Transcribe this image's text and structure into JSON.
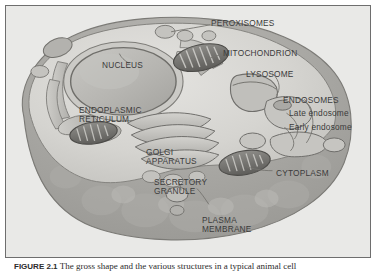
{
  "figure": {
    "caption_label": "FIGURE 2.1",
    "caption_text": "The gross shape and the various structures in a typical animal cell",
    "frame_color": "#6e6e6e",
    "background_color": "#e9e9e7"
  },
  "diagram": {
    "type": "biological-illustration",
    "palette": {
      "cytosol": "#d8d7d3",
      "cytosol_shadow": "#c2c1bd",
      "membrane": "#a9a8a4",
      "membrane_dark": "#8e8d89",
      "organelle_light": "#cfcecb",
      "organelle_mid": "#b4b3af",
      "organelle_dark": "#6f6e6b",
      "nucleus_fill": "#b9b8b4",
      "outline": "#74736f",
      "label_text": "#3b3b3b"
    },
    "labels": [
      {
        "id": "peroxisomes",
        "text": "PEROXISOMES",
        "style": "caps",
        "x": 205,
        "y": 13
      },
      {
        "id": "mitochondrion",
        "text": "MITOCHONDRION",
        "style": "caps",
        "x": 217,
        "y": 43
      },
      {
        "id": "lysosome",
        "text": "LYSOSOME",
        "style": "caps",
        "x": 240,
        "y": 64
      },
      {
        "id": "endosomes",
        "text": "ENDOSOMES",
        "style": "caps",
        "x": 277,
        "y": 90
      },
      {
        "id": "late-endosome",
        "text": "Late endosome",
        "style": "lower",
        "x": 283,
        "y": 103
      },
      {
        "id": "early-endosome",
        "text": "Early endosome",
        "style": "lower",
        "x": 283,
        "y": 117
      },
      {
        "id": "nucleus",
        "text": "NUCLEUS",
        "style": "caps",
        "x": 96,
        "y": 55
      },
      {
        "id": "endoplasmic-reticulum",
        "text": "ENDOPLASMIC\nRETICULUM",
        "style": "caps",
        "x": 73,
        "y": 100
      },
      {
        "id": "golgi-apparatus",
        "text": "GOLGI\nAPPARATUS",
        "style": "caps",
        "x": 140,
        "y": 142
      },
      {
        "id": "secretory-granule",
        "text": "SECRETORY\nGRANULE",
        "style": "caps",
        "x": 148,
        "y": 172
      },
      {
        "id": "cytoplasm",
        "text": "CYTOPLASM",
        "style": "caps",
        "x": 270,
        "y": 163
      },
      {
        "id": "plasma-membrane",
        "text": "PLASMA\nMEMBRANE",
        "style": "caps",
        "x": 196,
        "y": 210
      }
    ]
  }
}
